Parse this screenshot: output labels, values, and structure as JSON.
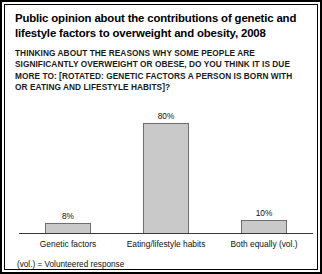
{
  "card": {
    "title": "Public opinion about the contributions of genetic and lifestyle factors to overweight and obesity, 2008",
    "question": "THINKING ABOUT THE REASONS WHY SOME PEOPLE ARE SIGNIFICANTLY OVERWEIGHT OR OBESE, DO YOU THINK IT IS DUE MORE TO: [ROTATED: GENETIC FACTORS A PERSON IS BORN WITH OR EATING AND LIFESTYLE HABITS]?",
    "footnote": "(vol.) = Volunteered response"
  },
  "chart_data": {
    "type": "bar",
    "title": "Public opinion about the contributions of genetic and lifestyle factors to overweight and obesity, 2008",
    "subtitle": "THINKING ABOUT THE REASONS WHY SOME PEOPLE ARE SIGNIFICANTLY OVERWEIGHT OR OBESE, DO YOU THINK IT IS DUE MORE TO: [ROTATED: GENETIC FACTORS A PERSON IS BORN WITH OR EATING AND LIFESTYLE HABITS]?",
    "categories": [
      "Genetic factors",
      "Eating/lifestyle habits",
      "Both equally (vol.)"
    ],
    "values": [
      8,
      80,
      10
    ],
    "value_labels": [
      "8%",
      "80%",
      "10%"
    ],
    "xlabel": "",
    "ylabel": "",
    "ylim": [
      0,
      96
    ],
    "grid": false,
    "legend": "none",
    "bar_color": "#c9c9c9",
    "bar_border_color": "#6e6e6e",
    "axis_color": "#3a3a3a",
    "annotation": "(vol.) = Volunteered response"
  }
}
